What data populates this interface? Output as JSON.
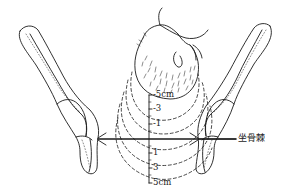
{
  "diagram": {
    "scale": {
      "labels": [
        "-5cm",
        "-3",
        "-1",
        "1",
        "3",
        "5cm"
      ]
    },
    "reference_line_label": "坐骨棘",
    "colors": {
      "ink": "#1a1a1a",
      "background": "#ffffff"
    }
  }
}
